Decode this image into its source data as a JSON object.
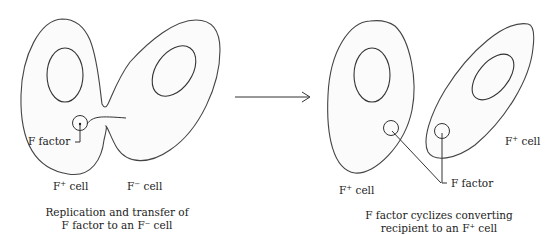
{
  "left_panel": {
    "label_f_factor": "F factor",
    "label_fplus_cell": "F",
    "label_fplus_sup": "+",
    "label_fplus_suffix": " cell",
    "label_fminus_cell": "F",
    "label_fminus_sup": "−",
    "label_fminus_suffix": " cell",
    "caption_line1": "Replication and transfer of",
    "caption_line2": "F factor to an F⁻ cell"
  },
  "right_panel": {
    "label_f_factor": "F factor",
    "label_cell_left": "F",
    "label_cell_left_sup": "+",
    "label_cell_left_suffix": " cell",
    "label_cell_right": "F",
    "label_cell_right_sup": "+",
    "label_cell_right_suffix": " cell",
    "caption_line1": "F factor cyclizes converting",
    "caption_line2": "recipient to an F⁺ cell"
  },
  "arrow": {
    "direction": "right"
  }
}
